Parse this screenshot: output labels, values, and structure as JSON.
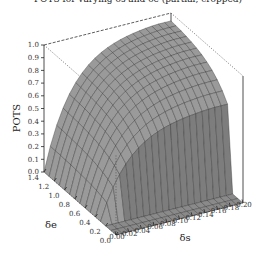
{
  "chart_data": {
    "type": "surface3d",
    "title": "POTS for varying δs and δe (partial, cropped)",
    "xlabel": "δs",
    "ylabel": "δe",
    "zlabel": "POTS",
    "x_ticks": [
      "0.00",
      "0.02",
      "0.04",
      "0.06",
      "0.08",
      "0.10",
      "0.12",
      "0.14",
      "0.16",
      "0.18",
      "0.20"
    ],
    "y_ticks": [
      "0.0",
      "0.2",
      "0.4",
      "0.6",
      "0.8",
      "1.0",
      "1.2",
      "1.4"
    ],
    "z_ticks": [
      "0.0",
      "0.1",
      "0.2",
      "0.3",
      "0.4",
      "0.5",
      "0.6",
      "0.7",
      "0.8",
      "0.9",
      "1.0"
    ],
    "xlim": [
      0,
      0.2
    ],
    "ylim": [
      0,
      1.4
    ],
    "zlim": [
      0,
      1.0
    ],
    "surface": {
      "description": "POTS is ~0 for δs≈0 and for small δe (below ~0.2); it rises steeply then saturates toward ~0.95 as δs and δe increase",
      "plateau": 0.95,
      "zero_region_delta_e_below": 0.2,
      "zero_region_delta_s_below": 0.005
    },
    "colors": {
      "surface": "#9a9a9a",
      "mesh": "#2a2a2a",
      "wall": "#7d7d7d"
    }
  }
}
